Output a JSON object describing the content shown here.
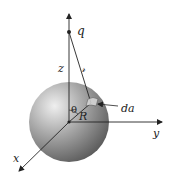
{
  "figure": {
    "type": "physics-diagram",
    "labels": {
      "charge": "q",
      "z_distance": "z",
      "separation": "𝓇",
      "angle": "θ",
      "radius": "R",
      "area_element": "da",
      "x_axis": "x",
      "y_axis": "y"
    },
    "colors": {
      "line": "#222222",
      "sphere_highlight": "#e6e6e6",
      "sphere_mid": "#9a9a9a",
      "sphere_shadow": "#5a5a5a",
      "background": "#ffffff"
    }
  }
}
